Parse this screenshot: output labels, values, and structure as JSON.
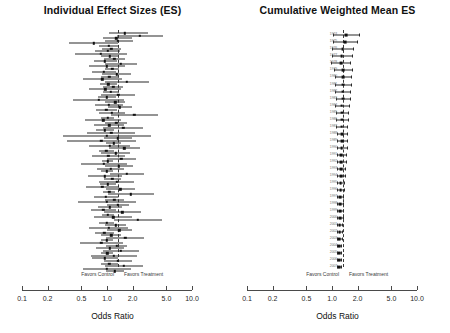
{
  "figure": {
    "width": 450,
    "height": 333,
    "background": "#ffffff",
    "ink": "#111111",
    "refline_color": "#3a3a3a",
    "year_label_color": "#6d6d6d"
  },
  "panels": [
    {
      "id": "individual",
      "title": "Individual Effect Sizes (ES)",
      "axis_title": "Odds Ratio",
      "favors_left": "Favors Control",
      "favors_right": "Favors Treatment",
      "show_year_labels": false
    },
    {
      "id": "cumulative",
      "title": "Cumulative Weighted Mean ES",
      "axis_title": "Odds Ratio",
      "favors_left": "Favors Control",
      "favors_right": "Favors Treatment",
      "show_year_labels": true
    }
  ],
  "axis": {
    "ticks": [
      0.1,
      0.2,
      0.5,
      1.0,
      2.0,
      5.0,
      10.0
    ],
    "tick_labels": [
      "0.1",
      "0.2",
      "0.5",
      "1.0",
      "2.0",
      "5.0",
      "10.0"
    ],
    "scale": "log",
    "xmin": 0.1,
    "xmax": 10.0,
    "reference": 1.0
  },
  "chart_data": {
    "type": "scatter",
    "xlabel": "Odds Ratio",
    "ylabel": "",
    "xscale": "log",
    "xlim": [
      0.1,
      10.0
    ],
    "reference_line": 1.0,
    "grid": false,
    "legend": "none",
    "annotations": [
      "Favors Control",
      "Favors Treatment"
    ],
    "series": [
      {
        "name": "Individual Effect Sizes (ES)",
        "panel": "individual",
        "marker": "square",
        "note": "Each row is one study: point estimate with 95% confidence interval whiskers.",
        "points": [
          {
            "or": 1.62,
            "lo": 1.05,
            "hi": 3.05
          },
          {
            "or": 2.45,
            "lo": 1.3,
            "hi": 4.6
          },
          {
            "or": 1.28,
            "lo": 0.9,
            "hi": 1.95
          },
          {
            "or": 1.34,
            "lo": 0.95,
            "hi": 2.0
          },
          {
            "or": 0.7,
            "lo": 0.36,
            "hi": 1.35
          },
          {
            "or": 1.05,
            "lo": 0.8,
            "hi": 1.4
          },
          {
            "or": 1.12,
            "lo": 0.88,
            "hi": 1.46
          },
          {
            "or": 1.02,
            "lo": 0.72,
            "hi": 1.44
          },
          {
            "or": 0.85,
            "lo": 0.42,
            "hi": 1.7
          },
          {
            "or": 1.08,
            "lo": 0.86,
            "hi": 1.36
          },
          {
            "or": 1.22,
            "lo": 0.92,
            "hi": 1.64
          },
          {
            "or": 0.95,
            "lo": 0.7,
            "hi": 1.3
          },
          {
            "or": 1.45,
            "lo": 0.95,
            "hi": 2.25
          },
          {
            "or": 1.0,
            "lo": 0.62,
            "hi": 1.62
          },
          {
            "or": 1.15,
            "lo": 0.95,
            "hi": 1.4
          },
          {
            "or": 0.92,
            "lo": 0.66,
            "hi": 1.28
          },
          {
            "or": 1.3,
            "lo": 0.88,
            "hi": 1.92
          },
          {
            "or": 1.06,
            "lo": 0.84,
            "hi": 1.34
          },
          {
            "or": 0.88,
            "lo": 0.52,
            "hi": 1.5
          },
          {
            "or": 1.7,
            "lo": 0.95,
            "hi": 3.1
          },
          {
            "or": 1.04,
            "lo": 0.82,
            "hi": 1.32
          },
          {
            "or": 1.18,
            "lo": 0.9,
            "hi": 1.55
          },
          {
            "or": 0.96,
            "lo": 0.62,
            "hi": 1.48
          },
          {
            "or": 1.1,
            "lo": 0.9,
            "hi": 1.35
          },
          {
            "or": 1.36,
            "lo": 0.86,
            "hi": 2.16
          },
          {
            "or": 1.0,
            "lo": 0.78,
            "hi": 1.28
          },
          {
            "or": 0.8,
            "lo": 0.4,
            "hi": 1.6
          },
          {
            "or": 1.25,
            "lo": 0.96,
            "hi": 1.64
          },
          {
            "or": 1.05,
            "lo": 0.72,
            "hi": 1.54
          },
          {
            "or": 1.42,
            "lo": 1.02,
            "hi": 1.98
          },
          {
            "or": 0.98,
            "lo": 0.74,
            "hi": 1.3
          },
          {
            "or": 1.14,
            "lo": 0.8,
            "hi": 1.64
          },
          {
            "or": 2.1,
            "lo": 1.1,
            "hi": 4.0
          },
          {
            "or": 1.02,
            "lo": 0.86,
            "hi": 1.22
          },
          {
            "or": 0.9,
            "lo": 0.55,
            "hi": 1.48
          },
          {
            "or": 1.28,
            "lo": 0.94,
            "hi": 1.74
          },
          {
            "or": 1.06,
            "lo": 0.7,
            "hi": 1.6
          },
          {
            "or": 1.55,
            "lo": 0.9,
            "hi": 2.65
          },
          {
            "or": 0.94,
            "lo": 0.74,
            "hi": 1.2
          },
          {
            "or": 1.12,
            "lo": 0.58,
            "hi": 2.15
          },
          {
            "or": 1.0,
            "lo": 0.3,
            "hi": 3.3
          },
          {
            "or": 1.34,
            "lo": 0.92,
            "hi": 1.95
          },
          {
            "or": 0.86,
            "lo": 0.34,
            "hi": 2.18
          },
          {
            "or": 1.2,
            "lo": 0.98,
            "hi": 1.47
          },
          {
            "or": 1.08,
            "lo": 0.62,
            "hi": 1.88
          },
          {
            "or": 1.6,
            "lo": 1.05,
            "hi": 2.45
          },
          {
            "or": 0.98,
            "lo": 0.8,
            "hi": 1.2
          },
          {
            "or": 1.26,
            "lo": 0.84,
            "hi": 1.88
          },
          {
            "or": 1.04,
            "lo": 0.66,
            "hi": 1.64
          },
          {
            "or": 1.48,
            "lo": 1.0,
            "hi": 2.2
          },
          {
            "or": 1.02,
            "lo": 0.88,
            "hi": 1.18
          },
          {
            "or": 0.92,
            "lo": 0.5,
            "hi": 1.7
          },
          {
            "or": 1.38,
            "lo": 0.95,
            "hi": 2.0
          },
          {
            "or": 1.1,
            "lo": 0.76,
            "hi": 1.6
          },
          {
            "or": 1.0,
            "lo": 0.84,
            "hi": 1.19
          },
          {
            "or": 1.72,
            "lo": 1.08,
            "hi": 2.74
          },
          {
            "or": 0.95,
            "lo": 0.6,
            "hi": 1.5
          },
          {
            "or": 1.16,
            "lo": 0.92,
            "hi": 1.46
          },
          {
            "or": 1.3,
            "lo": 0.8,
            "hi": 2.1
          },
          {
            "or": 1.02,
            "lo": 0.82,
            "hi": 1.27
          },
          {
            "or": 0.88,
            "lo": 0.56,
            "hi": 1.38
          },
          {
            "or": 1.44,
            "lo": 0.98,
            "hi": 2.12
          },
          {
            "or": 1.06,
            "lo": 0.9,
            "hi": 1.25
          },
          {
            "or": 1.9,
            "lo": 1.02,
            "hi": 3.54
          },
          {
            "or": 0.97,
            "lo": 0.7,
            "hi": 1.34
          },
          {
            "or": 1.22,
            "lo": 0.94,
            "hi": 1.58
          },
          {
            "or": 1.0,
            "lo": 0.46,
            "hi": 2.18
          },
          {
            "or": 1.34,
            "lo": 1.0,
            "hi": 1.8
          },
          {
            "or": 1.08,
            "lo": 0.78,
            "hi": 1.5
          },
          {
            "or": 0.9,
            "lo": 0.64,
            "hi": 1.27
          },
          {
            "or": 1.52,
            "lo": 0.92,
            "hi": 2.5
          },
          {
            "or": 1.03,
            "lo": 0.88,
            "hi": 1.2
          },
          {
            "or": 1.18,
            "lo": 0.7,
            "hi": 1.98
          },
          {
            "or": 2.3,
            "lo": 1.2,
            "hi": 4.4
          },
          {
            "or": 0.99,
            "lo": 0.8,
            "hi": 1.22
          },
          {
            "or": 1.26,
            "lo": 0.96,
            "hi": 1.66
          },
          {
            "or": 1.05,
            "lo": 0.62,
            "hi": 1.78
          },
          {
            "or": 1.4,
            "lo": 1.0,
            "hi": 1.96
          },
          {
            "or": 0.93,
            "lo": 0.72,
            "hi": 1.2
          },
          {
            "or": 1.12,
            "lo": 0.86,
            "hi": 1.46
          },
          {
            "or": 1.64,
            "lo": 0.98,
            "hi": 2.74
          },
          {
            "or": 1.0,
            "lo": 0.85,
            "hi": 1.18
          },
          {
            "or": 0.86,
            "lo": 0.48,
            "hi": 1.54
          },
          {
            "or": 1.3,
            "lo": 0.98,
            "hi": 1.72
          },
          {
            "or": 1.08,
            "lo": 0.74,
            "hi": 1.58
          },
          {
            "or": 1.46,
            "lo": 0.9,
            "hi": 2.36
          },
          {
            "or": 1.01,
            "lo": 0.86,
            "hi": 1.19
          },
          {
            "or": 1.2,
            "lo": 0.64,
            "hi": 2.24
          },
          {
            "or": 0.95,
            "lo": 0.66,
            "hi": 1.36
          },
          {
            "or": 1.35,
            "lo": 0.92,
            "hi": 1.98
          },
          {
            "or": 1.06,
            "lo": 0.84,
            "hi": 1.34
          },
          {
            "or": 1.58,
            "lo": 0.95,
            "hi": 2.62
          },
          {
            "or": 1.0,
            "lo": 0.52,
            "hi": 1.92
          },
          {
            "or": 1.24,
            "lo": 0.98,
            "hi": 1.57
          }
        ]
      },
      {
        "name": "Cumulative Weighted Mean ES",
        "panel": "cumulative",
        "marker": "square",
        "note": "Running weighted-mean odds ratio after adding each year of studies; confidence interval narrows over time.",
        "categories": [
          "1974",
          "1975",
          "1976",
          "1977",
          "1978",
          "1979",
          "1980",
          "1981",
          "1982",
          "1983",
          "1984",
          "1985",
          "1986",
          "1987",
          "1988",
          "1989",
          "1990",
          "1991",
          "1992",
          "1993",
          "1994",
          "1995",
          "1996",
          "1997",
          "1998",
          "1999",
          "2000",
          "2001",
          "2002",
          "2003",
          "2004",
          "2005",
          "2006",
          "2007"
        ],
        "points": [
          {
            "year": "1974",
            "or": 1.46,
            "lo": 1.02,
            "hi": 2.1
          },
          {
            "year": "1975",
            "or": 1.42,
            "lo": 1.02,
            "hi": 1.98
          },
          {
            "year": "1976",
            "or": 1.33,
            "lo": 1.0,
            "hi": 1.78
          },
          {
            "year": "1977",
            "or": 1.3,
            "lo": 0.99,
            "hi": 1.72
          },
          {
            "year": "1978",
            "or": 1.27,
            "lo": 0.98,
            "hi": 1.65
          },
          {
            "year": "1979",
            "or": 1.36,
            "lo": 1.06,
            "hi": 1.74
          },
          {
            "year": "1980",
            "or": 1.35,
            "lo": 1.08,
            "hi": 1.69
          },
          {
            "year": "1981",
            "or": 1.34,
            "lo": 1.08,
            "hi": 1.66
          },
          {
            "year": "1982",
            "or": 1.33,
            "lo": 1.08,
            "hi": 1.63
          },
          {
            "year": "1983",
            "or": 1.35,
            "lo": 1.11,
            "hi": 1.64
          },
          {
            "year": "1984",
            "or": 1.3,
            "lo": 1.08,
            "hi": 1.57
          },
          {
            "year": "1985",
            "or": 1.31,
            "lo": 1.1,
            "hi": 1.56
          },
          {
            "year": "1986",
            "or": 1.32,
            "lo": 1.12,
            "hi": 1.56
          },
          {
            "year": "1987",
            "or": 1.3,
            "lo": 1.11,
            "hi": 1.52
          },
          {
            "year": "1988",
            "or": 1.31,
            "lo": 1.13,
            "hi": 1.52
          },
          {
            "year": "1989",
            "or": 1.32,
            "lo": 1.15,
            "hi": 1.52
          },
          {
            "year": "1990",
            "or": 1.3,
            "lo": 1.14,
            "hi": 1.49
          },
          {
            "year": "1991",
            "or": 1.28,
            "lo": 1.13,
            "hi": 1.45
          },
          {
            "year": "1992",
            "or": 1.29,
            "lo": 1.15,
            "hi": 1.45
          },
          {
            "year": "1993",
            "or": 1.28,
            "lo": 1.15,
            "hi": 1.43
          },
          {
            "year": "1994",
            "or": 1.27,
            "lo": 1.15,
            "hi": 1.41
          },
          {
            "year": "1995",
            "or": 1.26,
            "lo": 1.15,
            "hi": 1.39
          },
          {
            "year": "1996",
            "or": 1.26,
            "lo": 1.15,
            "hi": 1.38
          },
          {
            "year": "1997",
            "or": 1.25,
            "lo": 1.15,
            "hi": 1.36
          },
          {
            "year": "1998",
            "or": 1.25,
            "lo": 1.16,
            "hi": 1.35
          },
          {
            "year": "1999",
            "or": 1.24,
            "lo": 1.15,
            "hi": 1.34
          },
          {
            "year": "2000",
            "or": 1.24,
            "lo": 1.16,
            "hi": 1.33
          },
          {
            "year": "2001",
            "or": 1.23,
            "lo": 1.15,
            "hi": 1.32
          },
          {
            "year": "2002",
            "or": 1.23,
            "lo": 1.16,
            "hi": 1.31
          },
          {
            "year": "2003",
            "or": 1.22,
            "lo": 1.15,
            "hi": 1.3
          },
          {
            "year": "2004",
            "or": 1.22,
            "lo": 1.16,
            "hi": 1.29
          },
          {
            "year": "2005",
            "or": 1.22,
            "lo": 1.16,
            "hi": 1.28
          },
          {
            "year": "2006",
            "or": 1.21,
            "lo": 1.16,
            "hi": 1.27
          },
          {
            "year": "2007",
            "or": 1.21,
            "lo": 1.16,
            "hi": 1.27
          }
        ]
      }
    ]
  }
}
